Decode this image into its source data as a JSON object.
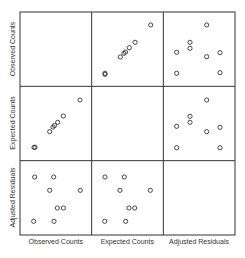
{
  "chart_data": {
    "type": "scatter",
    "title": "",
    "variables": [
      "Observed Counts",
      "Expected Counts",
      "Adjusted Residuals"
    ],
    "layout": "scatterplot-matrix 3x3, diagonal cells empty, no tick labels, no grid",
    "grid": false,
    "legend": "none",
    "colors": {
      "frame": "#333333",
      "marker": "#333333",
      "label": "#333333",
      "background": "#ffffff"
    },
    "panel": {
      "left": 20,
      "top": 12,
      "right": 235,
      "bottom": 235
    },
    "cells": [
      {
        "row": 0,
        "col": 1,
        "y_var": "Observed Counts",
        "x_var": "Expected Counts",
        "points_px": [
          [
            150.7,
            25
          ],
          [
            135,
            42.3
          ],
          [
            129.3,
            47.7
          ],
          [
            125.5,
            52
          ],
          [
            124,
            53.3
          ],
          [
            120.3,
            57
          ],
          [
            105,
            73.3
          ],
          [
            105,
            74.3
          ]
        ]
      },
      {
        "row": 0,
        "col": 2,
        "y_var": "Observed Counts",
        "x_var": "Adjusted Residuals",
        "points_px": [
          [
            206.7,
            25
          ],
          [
            190,
            42.3
          ],
          [
            190,
            48.3
          ],
          [
            176.7,
            52.3
          ],
          [
            206.7,
            56.7
          ],
          [
            220,
            52.7
          ],
          [
            176.7,
            73.3
          ],
          [
            220,
            72.7
          ]
        ]
      },
      {
        "row": 1,
        "col": 0,
        "y_var": "Expected Counts",
        "x_var": "Observed Counts",
        "points_px": [
          [
            80,
            100
          ],
          [
            63.3,
            116
          ],
          [
            57.7,
            122.3
          ],
          [
            54.5,
            125.5
          ],
          [
            53,
            127
          ],
          [
            49.7,
            131.7
          ],
          [
            34,
            147.3
          ],
          [
            35,
            147.3
          ]
        ]
      },
      {
        "row": 1,
        "col": 2,
        "y_var": "Expected Counts",
        "x_var": "Adjusted Residuals",
        "points_px": [
          [
            206.7,
            100
          ],
          [
            190,
            116.3
          ],
          [
            190,
            122.3
          ],
          [
            176.7,
            126.3
          ],
          [
            206.7,
            131.7
          ],
          [
            220,
            127.3
          ],
          [
            176.7,
            147.7
          ],
          [
            220,
            147.7
          ]
        ]
      },
      {
        "row": 2,
        "col": 0,
        "y_var": "Adjusted Residuals",
        "x_var": "Observed Counts",
        "points_px": [
          [
            34.7,
            177
          ],
          [
            53.7,
            177
          ],
          [
            49.7,
            190.3
          ],
          [
            80.3,
            190.3
          ],
          [
            57.3,
            208
          ],
          [
            63.3,
            208
          ],
          [
            33.7,
            221.3
          ],
          [
            54,
            221.3
          ]
        ]
      },
      {
        "row": 2,
        "col": 1,
        "y_var": "Adjusted Residuals",
        "x_var": "Expected Counts",
        "points_px": [
          [
            105,
            177
          ],
          [
            124.3,
            177
          ],
          [
            120,
            190.3
          ],
          [
            150.3,
            190.3
          ],
          [
            129,
            208
          ],
          [
            134.7,
            208
          ],
          [
            104.7,
            221.3
          ],
          [
            125.7,
            221.3
          ]
        ]
      }
    ],
    "xlabels": [
      "Observed Counts",
      "Expected Counts",
      "Adjusted Residuals"
    ],
    "ylabels": [
      "Observed Counts",
      "Expected Counts",
      "Adjusted Residuals"
    ]
  }
}
